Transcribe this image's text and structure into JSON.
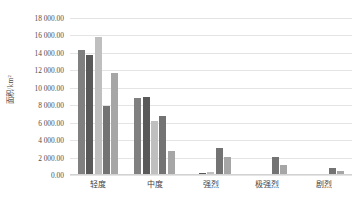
{
  "chart_data": {
    "type": "bar",
    "title": "",
    "xlabel": "",
    "ylabel": "面积/km²",
    "ylim": [
      0,
      18000
    ],
    "grid": true,
    "legend": "none",
    "categories": [
      "轻度",
      "中度",
      "强烈",
      "极强烈",
      "剧烈"
    ],
    "ytick_labels": [
      "0.00",
      "2 000.00",
      "4 000.00",
      "6 000.00",
      "8 000.00",
      "10 000.00",
      "12 000.00",
      "14 000.00",
      "16 000.00",
      "18 000.00"
    ],
    "ytick_values": [
      0,
      2000,
      4000,
      6000,
      8000,
      10000,
      12000,
      14000,
      16000,
      18000
    ],
    "series": [
      {
        "name": "系列1",
        "color": "#808080",
        "values": [
          14300,
          8800,
          160,
          60,
          0
        ]
      },
      {
        "name": "系列2",
        "color": "#595959",
        "values": [
          13800,
          9000,
          190,
          70,
          0
        ]
      },
      {
        "name": "系列3",
        "color": "#bfbfbf",
        "values": [
          15800,
          6150,
          330,
          120,
          0
        ]
      },
      {
        "name": "系列4",
        "color": "#737373",
        "values": [
          7950,
          6800,
          3150,
          2100,
          800
        ]
      },
      {
        "name": "系列5",
        "color": "#a6a6a6",
        "values": [
          11750,
          2800,
          2050,
          1100,
          450
        ]
      }
    ]
  }
}
